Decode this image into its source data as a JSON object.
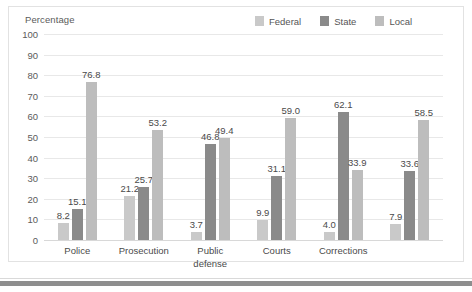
{
  "chart_data": {
    "type": "bar",
    "title": "",
    "subtitle": "",
    "xlabel": "",
    "ylabel": "Percentage",
    "ylim": [
      0,
      100
    ],
    "ytick_step": 10,
    "yticks": [
      "100",
      "90",
      "80",
      "70",
      "60",
      "50",
      "40",
      "30",
      "20",
      "10",
      "0"
    ],
    "grid": true,
    "legend_position": "top-right",
    "categories": [
      "Police",
      "Prosecution",
      "Public\ndefense",
      "Courts",
      "Corrections",
      ""
    ],
    "series": [
      {
        "name": "Federal",
        "color": "#c9c9c9",
        "values": [
          8.2,
          21.2,
          3.7,
          9.9,
          4.0,
          7.9
        ],
        "labels": [
          "8.2",
          "21.2",
          "3.7",
          "9.9",
          "4.0",
          "7.9"
        ]
      },
      {
        "name": "State",
        "color": "#8a8a8a",
        "values": [
          15.1,
          25.7,
          46.8,
          31.1,
          62.1,
          33.6
        ],
        "labels": [
          "15.1",
          "25.7",
          "46.8",
          "31.1",
          "62.1",
          "33.6"
        ]
      },
      {
        "name": "Local",
        "color": "#bdbdbd",
        "values": [
          76.8,
          53.2,
          49.4,
          59.0,
          33.9,
          58.5
        ],
        "labels": [
          "76.8",
          "53.2",
          "49.4",
          "59.0",
          "33.9",
          "58.5"
        ]
      }
    ]
  },
  "axis": {
    "y_title": "Percentage"
  },
  "legend": {
    "items": [
      {
        "label": "Federal",
        "color": "#c9c9c9"
      },
      {
        "label": "State",
        "color": "#8a8a8a"
      },
      {
        "label": "Local",
        "color": "#bdbdbd"
      }
    ]
  },
  "colors": {
    "federal": "#c9c9c9",
    "state": "#8a8a8a",
    "local": "#bdbdbd",
    "gridline": "#e8e8e8",
    "frame": "#e2e2e2",
    "text": "#4a4a4a",
    "bottom_rule": "#8e8e8e"
  }
}
